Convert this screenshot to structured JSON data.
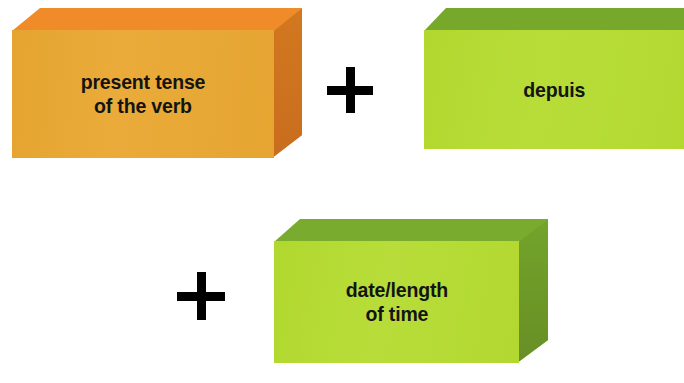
{
  "diagram": {
    "background_color": "#ffffff",
    "blocks": [
      {
        "id": "present-tense-verb",
        "label": "present tense\nof the verb",
        "shape": "3d-box",
        "front_color": "#e7a534",
        "top_color": "#ef8b28",
        "side_color": "#cf7422",
        "text_color": "#141414"
      },
      {
        "id": "depuis",
        "label": "depuis",
        "shape": "3d-box",
        "front_color": "#b4da32",
        "top_color": "#76a82c",
        "side_color": "#6d9c29",
        "text_color": "#141414"
      },
      {
        "id": "date-length-of-time",
        "label": "date/length\nof time",
        "shape": "3d-box",
        "front_color": "#b4da32",
        "top_color": "#79ab2e",
        "side_color": "#6d9c29",
        "text_color": "#141414"
      }
    ],
    "operators": [
      {
        "id": "plus-1",
        "symbol": "+",
        "color": "#000000"
      },
      {
        "id": "plus-2",
        "symbol": "+",
        "color": "#000000"
      }
    ]
  }
}
